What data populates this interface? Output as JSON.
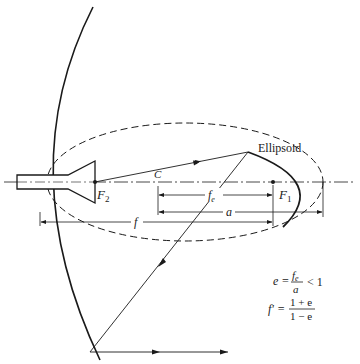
{
  "diagram": {
    "labels": {
      "ellipsoid": "Ellipsoid",
      "f2_main": "F",
      "f2_sub": "2",
      "f1_main": "F",
      "f1_sub": "1",
      "center": "C",
      "fe_main": "f",
      "fe_sub": "e",
      "a": "a",
      "f": "f"
    },
    "equations": {
      "eccentricity": {
        "lhs": "e =",
        "num_main": "f",
        "num_sub": "e",
        "den": "a",
        "rhs": "< 1"
      },
      "magnification": {
        "lhs": "f' =",
        "num": "1 + e",
        "den": "1 − e"
      }
    },
    "colors": {
      "stroke": "#1a1a1a",
      "background": "#ffffff"
    }
  }
}
